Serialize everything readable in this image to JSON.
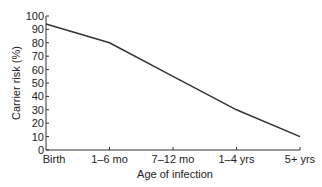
{
  "chart_data": {
    "type": "line",
    "title": "",
    "xlabel": "Age of infection",
    "ylabel": "Carrier risk (%)",
    "categories": [
      "Birth",
      "1–6 mo",
      "7–12 mo",
      "1–4 yrs",
      "5+ yrs"
    ],
    "series": [
      {
        "name": "Carrier risk",
        "values": [
          94,
          80,
          55,
          30,
          10
        ]
      }
    ],
    "ylim": [
      0,
      100
    ],
    "yticks": [
      0,
      10,
      20,
      30,
      40,
      50,
      60,
      70,
      80,
      90,
      100
    ],
    "grid": false,
    "legend": null,
    "line_color": "#333333"
  }
}
